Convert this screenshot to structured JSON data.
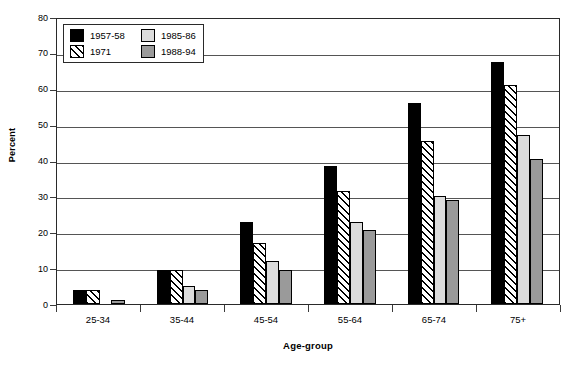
{
  "chart_data": {
    "type": "bar",
    "title": "",
    "xlabel": "Age-group",
    "ylabel": "Percent",
    "ylim": [
      0,
      80
    ],
    "yticks": [
      0,
      10,
      20,
      30,
      40,
      50,
      60,
      70,
      80
    ],
    "grid": true,
    "legend_position": "top-left",
    "categories": [
      "25-34",
      "35-44",
      "45-54",
      "55-64",
      "65-74",
      "75+"
    ],
    "series": [
      {
        "name": "1957-58",
        "color": "#000000",
        "pattern": "solid",
        "values": [
          4.0,
          9.5,
          23.0,
          38.5,
          56.0,
          67.5
        ]
      },
      {
        "name": "1971",
        "color": "#ffffff",
        "pattern": "hatch",
        "values": [
          4.0,
          9.5,
          17.0,
          31.5,
          45.5,
          61.0
        ]
      },
      {
        "name": "1985-86",
        "color": "#dcdcdc",
        "pattern": "solid",
        "values": [
          0.0,
          5.0,
          12.0,
          23.0,
          30.0,
          47.0
        ]
      },
      {
        "name": "1988-94",
        "color": "#9a9a9a",
        "pattern": "solid",
        "values": [
          1.0,
          4.0,
          9.5,
          20.5,
          29.0,
          40.5
        ]
      }
    ]
  },
  "axis": {
    "y_title": "Percent",
    "x_title": "Age-group",
    "y_tick_labels": [
      "80",
      "70",
      "60",
      "50",
      "40",
      "30",
      "20",
      "10",
      "0"
    ]
  },
  "legend": {
    "entries": [
      {
        "label": "1957-58"
      },
      {
        "label": "1985-86"
      },
      {
        "label": "1971"
      },
      {
        "label": "1988-94"
      }
    ]
  }
}
